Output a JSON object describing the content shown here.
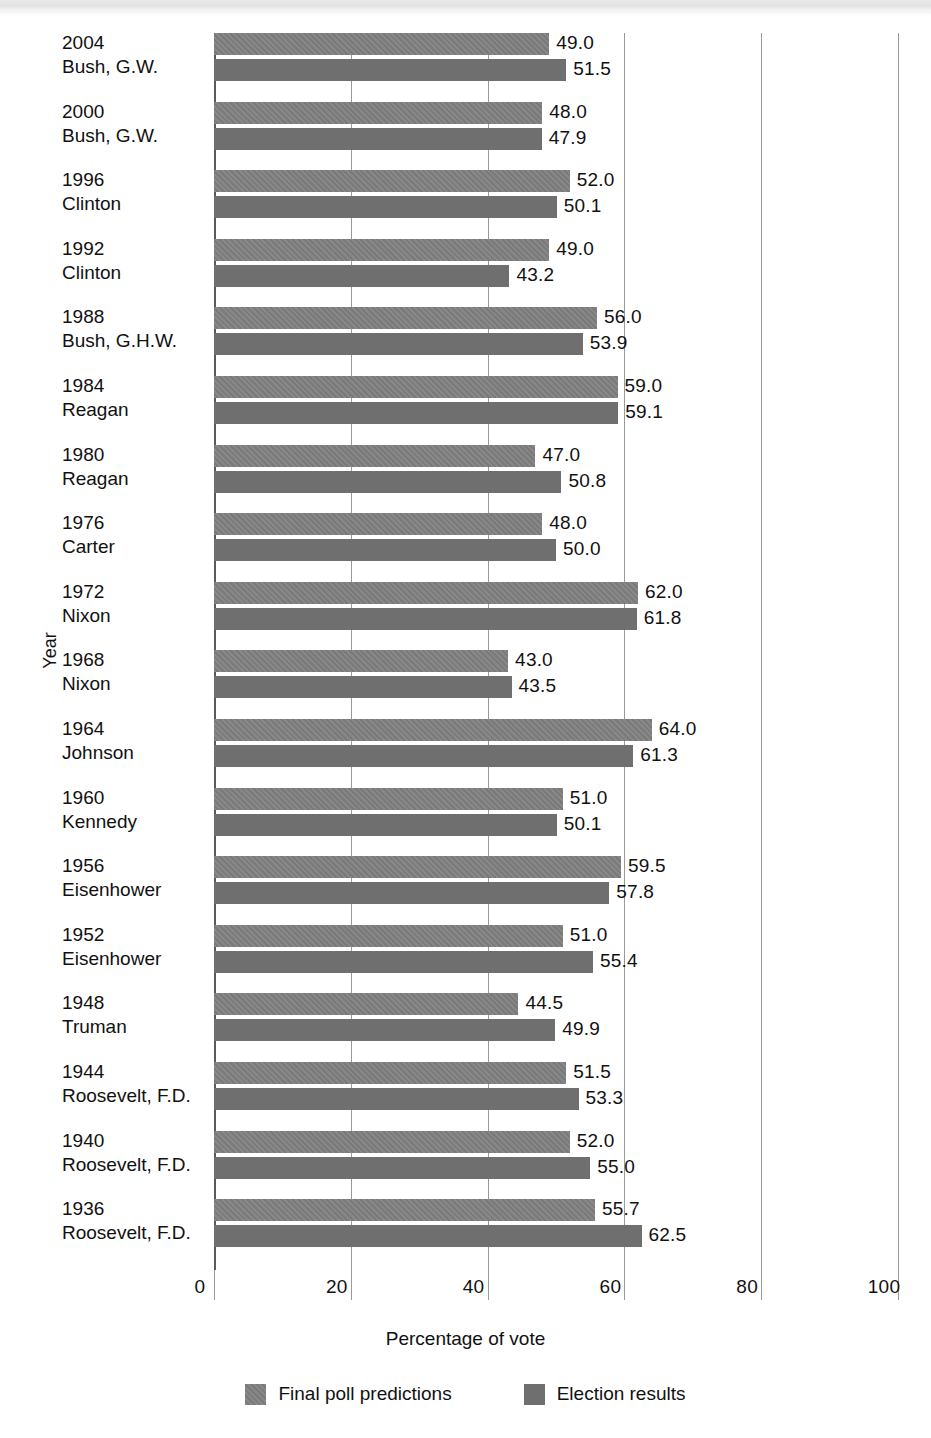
{
  "chart_data": {
    "type": "bar",
    "orientation": "horizontal",
    "title": "",
    "xlabel": "Percentage of vote",
    "ylabel": "Year",
    "xlim": [
      0,
      100
    ],
    "xticks": [
      0,
      20,
      40,
      60,
      80,
      100
    ],
    "xtick_labels": [
      "0",
      "20",
      "40",
      "60",
      "80",
      "100"
    ],
    "grid": true,
    "legend_position": "bottom",
    "legend": [
      "Final poll predictions",
      "Election results"
    ],
    "categories": [
      "2004 Bush, G.W.",
      "2000 Bush, G.W.",
      "1996 Clinton",
      "1992 Clinton",
      "1988 Bush, G.H.W.",
      "1984 Reagan",
      "1980 Reagan",
      "1976 Carter",
      "1972 Nixon",
      "1968 Nixon",
      "1964 Johnson",
      "1960 Kennedy",
      "1956 Eisenhower",
      "1952 Eisenhower",
      "1948 Truman",
      "1944 Roosevelt, F.D.",
      "1940 Roosevelt, F.D.",
      "1936 Roosevelt, F.D."
    ],
    "series": [
      {
        "name": "Final poll predictions",
        "values": [
          49.0,
          48.0,
          52.0,
          49.0,
          56.0,
          59.0,
          47.0,
          48.0,
          62.0,
          43.0,
          64.0,
          51.0,
          59.5,
          51.0,
          44.5,
          51.5,
          52.0,
          55.7
        ]
      },
      {
        "name": "Election results",
        "values": [
          51.5,
          47.9,
          50.1,
          43.2,
          53.9,
          59.1,
          50.8,
          50.0,
          61.8,
          43.5,
          61.3,
          50.1,
          57.8,
          55.4,
          49.9,
          53.3,
          55.0,
          62.5
        ]
      }
    ]
  },
  "groups": [
    {
      "year": "2004",
      "name": "Bush, G.W.",
      "poll": 49.0,
      "poll_label": "49.0",
      "result": 51.5,
      "result_label": "51.5"
    },
    {
      "year": "2000",
      "name": "Bush, G.W.",
      "poll": 48.0,
      "poll_label": "48.0",
      "result": 47.9,
      "result_label": "47.9"
    },
    {
      "year": "1996",
      "name": "Clinton",
      "poll": 52.0,
      "poll_label": "52.0",
      "result": 50.1,
      "result_label": "50.1"
    },
    {
      "year": "1992",
      "name": "Clinton",
      "poll": 49.0,
      "poll_label": "49.0",
      "result": 43.2,
      "result_label": "43.2"
    },
    {
      "year": "1988",
      "name": "Bush, G.H.W.",
      "poll": 56.0,
      "poll_label": "56.0",
      "result": 53.9,
      "result_label": "53.9"
    },
    {
      "year": "1984",
      "name": "Reagan",
      "poll": 59.0,
      "poll_label": "59.0",
      "result": 59.1,
      "result_label": "59.1"
    },
    {
      "year": "1980",
      "name": "Reagan",
      "poll": 47.0,
      "poll_label": "47.0",
      "result": 50.8,
      "result_label": "50.8"
    },
    {
      "year": "1976",
      "name": "Carter",
      "poll": 48.0,
      "poll_label": "48.0",
      "result": 50.0,
      "result_label": "50.0"
    },
    {
      "year": "1972",
      "name": "Nixon",
      "poll": 62.0,
      "poll_label": "62.0",
      "result": 61.8,
      "result_label": "61.8"
    },
    {
      "year": "1968",
      "name": "Nixon",
      "poll": 43.0,
      "poll_label": "43.0",
      "result": 43.5,
      "result_label": "43.5"
    },
    {
      "year": "1964",
      "name": "Johnson",
      "poll": 64.0,
      "poll_label": "64.0",
      "result": 61.3,
      "result_label": "61.3"
    },
    {
      "year": "1960",
      "name": "Kennedy",
      "poll": 51.0,
      "poll_label": "51.0",
      "result": 50.1,
      "result_label": "50.1"
    },
    {
      "year": "1956",
      "name": "Eisenhower",
      "poll": 59.5,
      "poll_label": "59.5",
      "result": 57.8,
      "result_label": "57.8"
    },
    {
      "year": "1952",
      "name": "Eisenhower",
      "poll": 51.0,
      "poll_label": "51.0",
      "result": 55.4,
      "result_label": "55.4"
    },
    {
      "year": "1948",
      "name": "Truman",
      "poll": 44.5,
      "poll_label": "44.5",
      "result": 49.9,
      "result_label": "49.9"
    },
    {
      "year": "1944",
      "name": "Roosevelt, F.D.",
      "poll": 51.5,
      "poll_label": "51.5",
      "result": 53.3,
      "result_label": "53.3"
    },
    {
      "year": "1940",
      "name": "Roosevelt, F.D.",
      "poll": 52.0,
      "poll_label": "52.0",
      "result": 55.0,
      "result_label": "55.0"
    },
    {
      "year": "1936",
      "name": "Roosevelt, F.D.",
      "poll": 55.7,
      "poll_label": "55.7",
      "result": 62.5,
      "result_label": "62.5"
    }
  ],
  "axis": {
    "x_title": "Percentage of vote",
    "y_title": "Year",
    "ticks": [
      "0",
      "20",
      "40",
      "60",
      "80",
      "100"
    ],
    "tick_values": [
      0,
      20,
      40,
      60,
      80,
      100
    ]
  },
  "legend": {
    "items": [
      {
        "label": "Final poll predictions",
        "kind": "poll"
      },
      {
        "label": "Election results",
        "kind": "result"
      }
    ]
  },
  "colors": {
    "bar_poll": "#7a7a7a",
    "bar_result": "#6f6f6f",
    "gridline": "#9a9a9a",
    "axis": "#5a5a5a",
    "text": "#111111"
  }
}
